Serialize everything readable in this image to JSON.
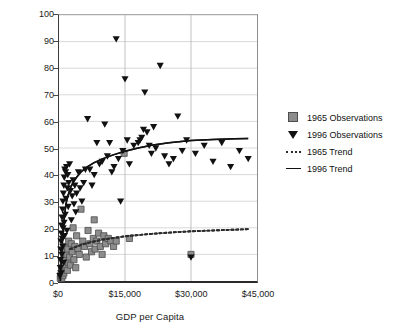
{
  "chart_data": {
    "type": "scatter",
    "title": "",
    "xlabel": "GDP per Capita",
    "ylabel": "School Enrollment",
    "xlim": [
      0,
      45000
    ],
    "ylim": [
      0,
      100
    ],
    "xticks": [
      "$0",
      "$15,000",
      "$30,000",
      "$45,000"
    ],
    "xtick_values": [
      0,
      15000,
      30000,
      45000
    ],
    "yticks": [
      "0",
      "10",
      "20",
      "30",
      "40",
      "50",
      "60",
      "70",
      "80",
      "90",
      "100"
    ],
    "ytick_values": [
      0,
      10,
      20,
      30,
      40,
      50,
      60,
      70,
      80,
      90,
      100
    ],
    "grid": true,
    "legend_position": "right",
    "series": [
      {
        "name": "1965 Observations",
        "marker": "square",
        "color": "#8d8d8d",
        "points": [
          [
            300,
            1
          ],
          [
            400,
            2
          ],
          [
            500,
            3
          ],
          [
            600,
            1
          ],
          [
            700,
            4
          ],
          [
            800,
            5
          ],
          [
            900,
            2
          ],
          [
            1000,
            7
          ],
          [
            1100,
            3
          ],
          [
            1200,
            9
          ],
          [
            1300,
            6
          ],
          [
            1400,
            11
          ],
          [
            1500,
            8
          ],
          [
            1600,
            5
          ],
          [
            1700,
            13
          ],
          [
            1800,
            10
          ],
          [
            1900,
            4
          ],
          [
            2000,
            12
          ],
          [
            2100,
            7
          ],
          [
            2200,
            15
          ],
          [
            2400,
            9
          ],
          [
            2600,
            6
          ],
          [
            2800,
            14
          ],
          [
            3000,
            11
          ],
          [
            3200,
            20
          ],
          [
            3400,
            8
          ],
          [
            3600,
            13
          ],
          [
            3800,
            5
          ],
          [
            4000,
            17
          ],
          [
            4300,
            12
          ],
          [
            4600,
            10
          ],
          [
            5000,
            27
          ],
          [
            5400,
            15
          ],
          [
            5800,
            13
          ],
          [
            6200,
            9
          ],
          [
            6600,
            19
          ],
          [
            7000,
            14
          ],
          [
            7400,
            11
          ],
          [
            7800,
            16
          ],
          [
            8000,
            23
          ],
          [
            8200,
            12
          ],
          [
            8600,
            15
          ],
          [
            9000,
            18
          ],
          [
            9400,
            13
          ],
          [
            9800,
            10
          ],
          [
            10200,
            17
          ],
          [
            10600,
            14
          ],
          [
            11200,
            16
          ],
          [
            11800,
            15
          ],
          [
            12400,
            13
          ],
          [
            13000,
            15
          ],
          [
            14800,
            48
          ],
          [
            16000,
            16
          ],
          [
            30000,
            10
          ]
        ]
      },
      {
        "name": "1996 Observations",
        "marker": "triangle-down",
        "color": "#111111",
        "points": [
          [
            200,
            2
          ],
          [
            300,
            5
          ],
          [
            350,
            8
          ],
          [
            400,
            12
          ],
          [
            450,
            15
          ],
          [
            500,
            3
          ],
          [
            550,
            18
          ],
          [
            600,
            21
          ],
          [
            650,
            10
          ],
          [
            700,
            24
          ],
          [
            750,
            16
          ],
          [
            800,
            27
          ],
          [
            850,
            13
          ],
          [
            900,
            30
          ],
          [
            950,
            20
          ],
          [
            1000,
            33
          ],
          [
            1050,
            7
          ],
          [
            1100,
            36
          ],
          [
            1150,
            22
          ],
          [
            1200,
            39
          ],
          [
            1250,
            17
          ],
          [
            1300,
            42
          ],
          [
            1400,
            25
          ],
          [
            1500,
            41
          ],
          [
            1600,
            31
          ],
          [
            1700,
            43
          ],
          [
            1800,
            19
          ],
          [
            1900,
            35
          ],
          [
            2000,
            40
          ],
          [
            2100,
            28
          ],
          [
            2200,
            37
          ],
          [
            2400,
            44
          ],
          [
            2600,
            34
          ],
          [
            2800,
            23
          ],
          [
            3000,
            32
          ],
          [
            3200,
            38
          ],
          [
            3400,
            29
          ],
          [
            3600,
            36
          ],
          [
            3800,
            26
          ],
          [
            4000,
            33
          ],
          [
            4400,
            41
          ],
          [
            4800,
            35
          ],
          [
            5200,
            30
          ],
          [
            5600,
            37
          ],
          [
            6000,
            42
          ],
          [
            6500,
            61
          ],
          [
            7000,
            42
          ],
          [
            7500,
            36
          ],
          [
            8000,
            40
          ],
          [
            8600,
            52
          ],
          [
            9200,
            44
          ],
          [
            9800,
            45
          ],
          [
            10400,
            59
          ],
          [
            11000,
            47
          ],
          [
            11500,
            52
          ],
          [
            12000,
            41
          ],
          [
            12500,
            43
          ],
          [
            13000,
            91
          ],
          [
            13500,
            46
          ],
          [
            14000,
            30
          ],
          [
            14500,
            49
          ],
          [
            15000,
            76
          ],
          [
            15500,
            53
          ],
          [
            16000,
            44
          ],
          [
            17000,
            51
          ],
          [
            18000,
            52
          ],
          [
            18400,
            53
          ],
          [
            18800,
            54
          ],
          [
            19200,
            57
          ],
          [
            19500,
            71
          ],
          [
            20000,
            56
          ],
          [
            20500,
            51
          ],
          [
            21000,
            48
          ],
          [
            21500,
            58
          ],
          [
            22000,
            50
          ],
          [
            23000,
            81
          ],
          [
            24000,
            47
          ],
          [
            25000,
            44
          ],
          [
            26000,
            46
          ],
          [
            27000,
            62
          ],
          [
            28000,
            49
          ],
          [
            29000,
            53
          ],
          [
            30000,
            9
          ],
          [
            31000,
            48
          ],
          [
            33000,
            51
          ],
          [
            35000,
            45
          ],
          [
            37000,
            52
          ],
          [
            39000,
            43
          ],
          [
            41000,
            49
          ],
          [
            43000,
            46
          ]
        ]
      }
    ],
    "trends": [
      {
        "name": "1965 Trend",
        "style": "dotted",
        "color": "#2b2b2b",
        "points": [
          [
            2500,
            12.0
          ],
          [
            5000,
            13.6
          ],
          [
            7500,
            14.7
          ],
          [
            10000,
            15.6
          ],
          [
            12500,
            16.2
          ],
          [
            15000,
            16.8
          ],
          [
            17500,
            17.2
          ],
          [
            20000,
            17.6
          ],
          [
            25000,
            18.2
          ],
          [
            30000,
            18.7
          ],
          [
            35000,
            19.0
          ],
          [
            40000,
            19.3
          ],
          [
            43000,
            19.5
          ]
        ]
      },
      {
        "name": "1996 Trend",
        "style": "solid",
        "color": "#111111",
        "points": [
          [
            300,
            0
          ],
          [
            600,
            10
          ],
          [
            900,
            18
          ],
          [
            1200,
            24
          ],
          [
            1600,
            29
          ],
          [
            2000,
            32
          ],
          [
            2600,
            35
          ],
          [
            3200,
            37
          ],
          [
            4000,
            39
          ],
          [
            5000,
            41
          ],
          [
            6500,
            43
          ],
          [
            8000,
            44.5
          ],
          [
            10000,
            46
          ],
          [
            12500,
            47.5
          ],
          [
            15000,
            48.8
          ],
          [
            18000,
            50
          ],
          [
            21000,
            51
          ],
          [
            25000,
            52
          ],
          [
            30000,
            52.8
          ],
          [
            35000,
            53.2
          ],
          [
            40000,
            53.5
          ],
          [
            43000,
            53.6
          ]
        ]
      }
    ]
  },
  "legend": {
    "items": [
      {
        "label": "1965 Observations",
        "key": "square-marker"
      },
      {
        "label": "1996 Observations",
        "key": "triangle-marker"
      },
      {
        "label": "1965 Trend",
        "key": "dotted-line"
      },
      {
        "label": "1996 Trend",
        "key": "solid-line"
      }
    ]
  }
}
